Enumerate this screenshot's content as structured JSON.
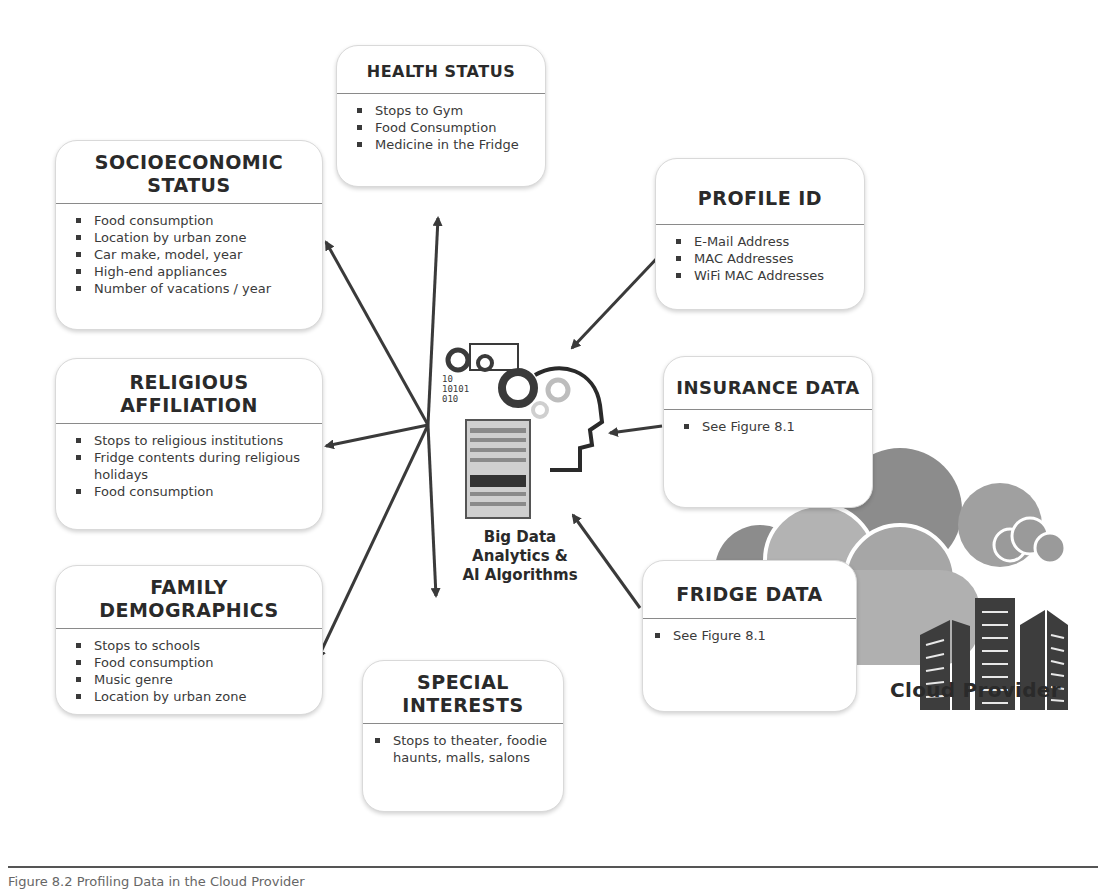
{
  "center": {
    "label_line1": "Big Data",
    "label_line2": "Analytics &",
    "label_line3": "AI Algorithms",
    "icon": "head-gears-server-icon"
  },
  "cloud": {
    "label": "Cloud Provider",
    "icon": "cloud-servers-icon"
  },
  "outputs": {
    "health_status": {
      "title": "HEALTH STATUS",
      "items": [
        "Stops to Gym",
        "Food Consumption",
        "Medicine in the Fridge"
      ]
    },
    "socioeconomic_status": {
      "title_line1": "SOCIOECONOMIC",
      "title_line2": "STATUS",
      "items": [
        "Food consumption",
        "Location by urban zone",
        "Car make, model, year",
        "High-end appliances",
        "Number of vacations / year"
      ]
    },
    "religious_affiliation": {
      "title_line1": "RELIGIOUS",
      "title_line2": "AFFILIATION",
      "items": [
        "Stops to religious institutions",
        "Fridge contents during religious holidays",
        "Food consumption"
      ]
    },
    "family_demographics": {
      "title_line1": "FAMILY",
      "title_line2": "DEMOGRAPHICS",
      "items": [
        "Stops to schools",
        "Food consumption",
        "Music genre",
        "Location by urban zone"
      ]
    },
    "special_interests": {
      "title_line1": "SPECIAL",
      "title_line2": "INTERESTS",
      "items": [
        "Stops to theater, foodie haunts, malls, salons"
      ]
    }
  },
  "inputs": {
    "profile_id": {
      "title": "PROFILE ID",
      "items": [
        "E-Mail Address",
        "MAC Addresses",
        "WiFi MAC Addresses"
      ]
    },
    "insurance_data": {
      "title": "INSURANCE DATA",
      "items": [
        "See Figure 8.1"
      ]
    },
    "fridge_data": {
      "title": "FRIDGE DATA",
      "items": [
        "See Figure 8.1"
      ]
    }
  },
  "caption": "Figure 8.2 Profiling Data in the Cloud Provider",
  "colors": {
    "arrow": "#3a3a3a",
    "cloud_dark": "#8c8c8c",
    "cloud_light": "#b8b8b8",
    "server": "#3d3d3d"
  }
}
